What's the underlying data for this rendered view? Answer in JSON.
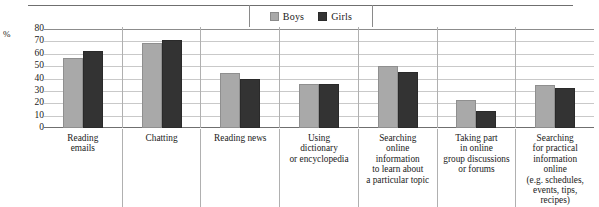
{
  "legend": {
    "items": [
      {
        "label": "Boys",
        "color": "#a9a9a9",
        "swatch_name": "legend-swatch-boys"
      },
      {
        "label": "Girls",
        "color": "#333333",
        "swatch_name": "legend-swatch-girls"
      }
    ]
  },
  "axis": {
    "percent_symbol": "%",
    "ticks": [
      "80",
      "70",
      "60",
      "50",
      "40",
      "30",
      "20",
      "10",
      "0"
    ]
  },
  "chart_data": {
    "type": "bar",
    "title": "",
    "xlabel": "",
    "ylabel": "%",
    "ylim": [
      0,
      80
    ],
    "ytick_step": 10,
    "grid": true,
    "legend_position": "top-center",
    "categories": [
      "Reading emails",
      "Chatting",
      "Reading news",
      "Using dictionary or encyclopedia",
      "Searching online information to learn about a particular topic",
      "Taking part in online group discussions or forums",
      "Searching for practical information online (e.g. schedules, events, tips, recipes)"
    ],
    "category_lines": [
      [
        "Reading",
        "emails"
      ],
      [
        "Chatting"
      ],
      [
        "Reading news"
      ],
      [
        "Using",
        "dictionary",
        "or encyclopedia"
      ],
      [
        "Searching",
        "online",
        "information",
        "to learn about",
        "a particular topic"
      ],
      [
        "Taking part",
        "in online",
        "group discussions",
        "or forums"
      ],
      [
        "Searching",
        "for practical",
        "information",
        "online",
        "(e.g. schedules,",
        "events, tips, recipes)"
      ]
    ],
    "series": [
      {
        "name": "Boys",
        "color": "#a9a9a9",
        "values": [
          57,
          69,
          45,
          36,
          51,
          23,
          35
        ]
      },
      {
        "name": "Girls",
        "color": "#333333",
        "values": [
          63,
          72,
          40,
          36,
          46,
          14,
          33
        ]
      }
    ]
  }
}
